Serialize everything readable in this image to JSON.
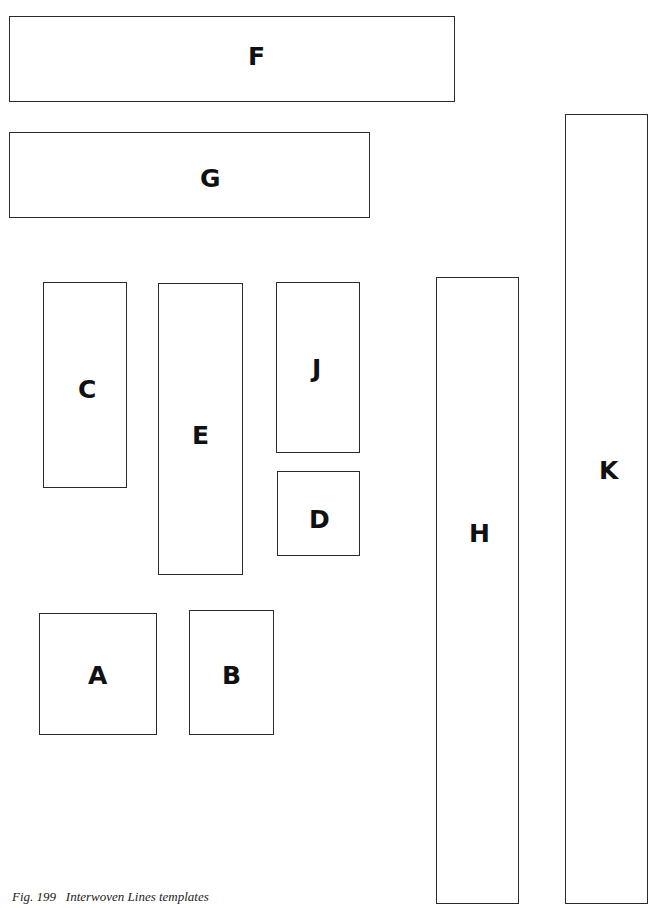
{
  "caption": "Fig. 199   Interwoven Lines templates",
  "templates": {
    "F": {
      "label": "F"
    },
    "G": {
      "label": "G"
    },
    "C": {
      "label": "C"
    },
    "E": {
      "label": "E"
    },
    "J": {
      "label": "J"
    },
    "D": {
      "label": "D"
    },
    "A": {
      "label": "A"
    },
    "B": {
      "label": "B"
    },
    "H": {
      "label": "H"
    },
    "K": {
      "label": "K"
    }
  }
}
